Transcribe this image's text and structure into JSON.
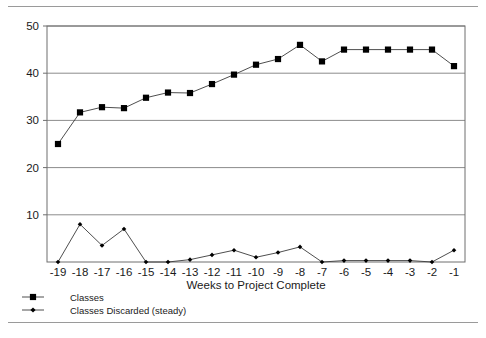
{
  "chart_data": {
    "type": "line",
    "title": "",
    "xlabel": "Weeks to Project Complete",
    "ylabel": "",
    "categories": [
      "-19",
      "-18",
      "-17",
      "-16",
      "-15",
      "-14",
      "-13",
      "-12",
      "-11",
      "-10",
      "-9",
      "-8",
      "-7",
      "-6",
      "-5",
      "-4",
      "-3",
      "-2",
      "-1"
    ],
    "x_tick_labels": [
      "-19",
      "-18",
      "-17",
      "-16",
      "-15",
      "-14",
      "-13",
      "-12",
      "-11",
      "-10",
      "-9",
      "-8",
      "-7",
      "-6",
      "-5",
      "-4",
      "-3",
      "-2",
      "-1"
    ],
    "y_tick_labels": [
      "10",
      "20",
      "30",
      "40",
      "50"
    ],
    "y_ticks": [
      10,
      20,
      30,
      40,
      50
    ],
    "ylim": [
      0,
      50
    ],
    "grid": "horizontal",
    "legend_position": "below-left",
    "series": [
      {
        "name": "Classes",
        "marker": "square",
        "values": [
          25,
          31.7,
          32.8,
          32.6,
          34.8,
          35.9,
          35.8,
          37.7,
          39.7,
          41.8,
          43.0,
          46.0,
          42.5,
          45.0,
          45.0,
          45.0,
          45.0,
          45.0,
          41.5
        ]
      },
      {
        "name": "Classes Discarded (steady)",
        "marker": "diamond",
        "values": [
          0,
          8.0,
          3.5,
          7.0,
          0,
          0,
          0.5,
          1.5,
          2.5,
          1.0,
          2.0,
          3.2,
          0,
          0.3,
          0.3,
          0.3,
          0.3,
          0,
          2.5
        ]
      }
    ]
  },
  "legend": {
    "items": [
      {
        "label": "Classes",
        "marker": "square-marker"
      },
      {
        "label": "Classes Discarded (steady)",
        "marker": "diamond-marker"
      }
    ]
  },
  "colors": {
    "series_line": "#3a3a3a",
    "marker_fill": "#000000",
    "grid": "#8c8c8c",
    "frame": "#6e6e6e",
    "rule": "#9a9a9a",
    "text": "#1a1a1a"
  }
}
